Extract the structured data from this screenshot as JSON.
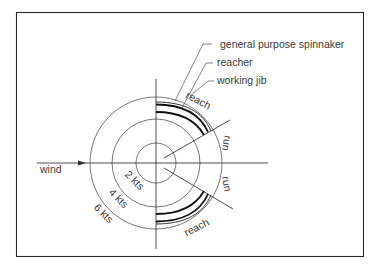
{
  "diagram": {
    "type": "polar sailing performance diagram",
    "legend": [
      {
        "label": "general purpose spinnaker"
      },
      {
        "label": "reacher"
      },
      {
        "label": "working jib"
      }
    ],
    "wind_label": "wind",
    "speed_rings": [
      {
        "label": "2 kts",
        "radius": 20
      },
      {
        "label": "4 kts",
        "radius": 44
      },
      {
        "label": "6 kts",
        "radius": 66
      }
    ],
    "sector_labels": {
      "top_reach": "reach",
      "top_run": "run",
      "bottom_run": "run",
      "bottom_reach": "reach"
    },
    "colors": {
      "line": "#3a3a3a",
      "background": "#ffffff"
    }
  }
}
